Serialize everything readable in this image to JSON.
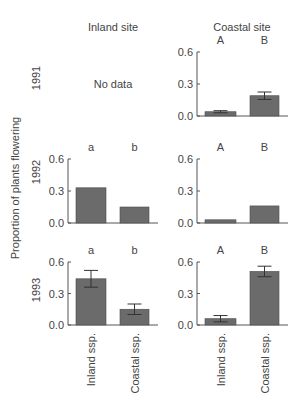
{
  "figure": {
    "col_headers": [
      "Inland site",
      "Coastal site"
    ],
    "row_headers": [
      "1991",
      "1992",
      "1993"
    ],
    "ylabel": "Proportion of plants flowering",
    "no_data_label": "No data",
    "xtick_labels": [
      "Inland ssp.",
      "Coastal ssp."
    ],
    "ytick_labels": [
      "0.0",
      "0.3",
      "0.6"
    ],
    "bar_color": "#6b6b6b",
    "axis_color": "#555555"
  },
  "chart_data": {
    "type": "bar",
    "title": "",
    "xlabel": "",
    "ylabel": "Proportion of plants flowering",
    "ylim": [
      0,
      0.6
    ],
    "yticks": [
      0.0,
      0.3,
      0.6
    ],
    "categories": [
      "Inland ssp.",
      "Coastal ssp."
    ],
    "grid": false,
    "legend": null,
    "panels": [
      {
        "year": "1991",
        "site": "Inland site",
        "no_data": true,
        "values": null,
        "errors": null,
        "letters": null
      },
      {
        "year": "1991",
        "site": "Coastal site",
        "no_data": false,
        "values": [
          0.04,
          0.19
        ],
        "errors": [
          0.01,
          0.035
        ],
        "letters": [
          "A",
          "B"
        ]
      },
      {
        "year": "1992",
        "site": "Inland site",
        "no_data": false,
        "values": [
          0.33,
          0.15
        ],
        "errors": [
          null,
          null
        ],
        "letters": [
          "a",
          "b"
        ]
      },
      {
        "year": "1992",
        "site": "Coastal site",
        "no_data": false,
        "values": [
          0.03,
          0.16
        ],
        "errors": [
          null,
          null
        ],
        "letters": [
          "A",
          "B"
        ]
      },
      {
        "year": "1993",
        "site": "Inland site",
        "no_data": false,
        "values": [
          0.44,
          0.15
        ],
        "errors": [
          0.08,
          0.05
        ],
        "letters": [
          "a",
          "b"
        ]
      },
      {
        "year": "1993",
        "site": "Coastal site",
        "no_data": false,
        "values": [
          0.06,
          0.51
        ],
        "errors": [
          0.03,
          0.05
        ],
        "letters": [
          "A",
          "B"
        ]
      }
    ]
  }
}
